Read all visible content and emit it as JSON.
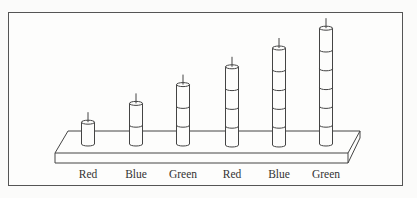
{
  "figure": {
    "labels": [
      "Red",
      "Blue",
      "Green",
      "Red",
      "Blue",
      "Green"
    ],
    "rods": [
      {
        "label": "Red",
        "segments": 1
      },
      {
        "label": "Blue",
        "segments": 2
      },
      {
        "label": "Green",
        "segments": 3
      },
      {
        "label": "Red",
        "segments": 4
      },
      {
        "label": "Blue",
        "segments": 5
      },
      {
        "label": "Green",
        "segments": 6
      }
    ],
    "colors": {
      "line": "#444444",
      "frame": "#555555",
      "background": "#fdfdfc"
    }
  }
}
